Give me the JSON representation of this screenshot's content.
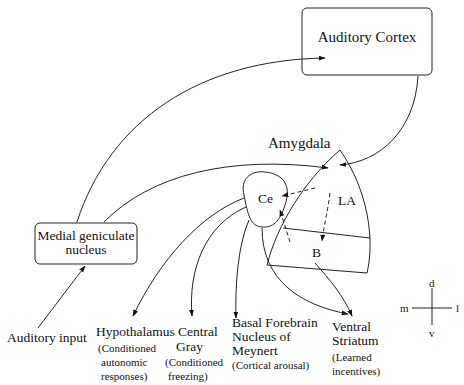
{
  "diagram": {
    "type": "neural-pathway-diagram",
    "nodes": {
      "auditory_cortex": {
        "label": "Auditory Cortex"
      },
      "medial_geniculate": {
        "label_line1": "Medial geniculate",
        "label_line2": "nucleus"
      },
      "auditory_input": {
        "label": "Auditory input"
      },
      "amygdala": {
        "label": "Amygdala"
      },
      "ce": {
        "label": "Ce"
      },
      "la": {
        "label": "LA"
      },
      "b": {
        "label": "B"
      }
    },
    "outputs": [
      {
        "name": "Hypothalamus",
        "lines": [
          "Hypothalamus"
        ],
        "note": [
          "(Conditioned",
          "autonomic",
          "responses)"
        ]
      },
      {
        "name": "Central Gray",
        "lines": [
          "Central",
          "Gray"
        ],
        "note": [
          "(Conditioned",
          "freezing)"
        ]
      },
      {
        "name": "Basal Forebrain Nucleus of Meynert",
        "lines": [
          "Basal Forebrain",
          "Nucleus of",
          "Meynert"
        ],
        "note": [
          "(Cortical arousal)"
        ]
      },
      {
        "name": "Ventral Striatum",
        "lines": [
          "Ventral",
          "Striatum"
        ],
        "note": [
          "(Learned",
          "incentives)"
        ]
      }
    ],
    "compass": {
      "up": "d",
      "down": "v",
      "left": "m",
      "right": "l"
    },
    "edges": [
      {
        "from": "Auditory input",
        "to": "Medial geniculate nucleus",
        "style": "solid"
      },
      {
        "from": "Medial geniculate nucleus",
        "to": "Auditory Cortex",
        "style": "solid"
      },
      {
        "from": "Medial geniculate nucleus",
        "to": "LA",
        "style": "solid"
      },
      {
        "from": "Auditory Cortex",
        "to": "LA",
        "style": "solid"
      },
      {
        "from": "LA",
        "to": "Ce",
        "style": "dashed"
      },
      {
        "from": "LA",
        "to": "B",
        "style": "dashed"
      },
      {
        "from": "B",
        "to": "Ce",
        "style": "dashed"
      },
      {
        "from": "Ce",
        "to": "Hypothalamus",
        "style": "solid"
      },
      {
        "from": "Ce",
        "to": "Central Gray",
        "style": "solid"
      },
      {
        "from": "Ce",
        "to": "Basal Forebrain Nucleus of Meynert",
        "style": "solid"
      },
      {
        "from": "Ce",
        "to": "Ventral Striatum",
        "style": "solid"
      },
      {
        "from": "B",
        "to": "Ventral Striatum",
        "style": "solid"
      }
    ]
  }
}
